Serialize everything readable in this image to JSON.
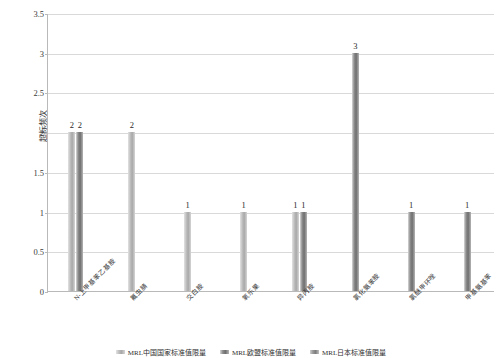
{
  "chart_data": {
    "type": "bar",
    "title": "",
    "xlabel": "",
    "ylabel": "超标频次",
    "ylim": [
      0,
      3.5
    ],
    "ytick_labels": [
      "0",
      "0.5",
      "1",
      "1.5",
      "2",
      "2.5",
      "3",
      "3.5"
    ],
    "ytick_values": [
      0,
      0.5,
      1,
      1.5,
      2,
      2.5,
      3,
      3.5
    ],
    "grid": true,
    "legend_position": "bottom",
    "categories": [
      "N-上甲基苯乙基胺",
      "氟虫腈",
      "交白胺",
      "氧乐果",
      "异丙胺",
      "氯化氨苯胺",
      "氯醚甲环唑",
      "甲基氨基苯"
    ],
    "series": [
      {
        "name": "MRL中国国家标准值限量",
        "color": "#bdbdbd",
        "values": [
          2,
          2,
          1,
          1,
          1,
          3,
          1,
          1
        ]
      },
      {
        "name": "MRL欧盟标准值限量",
        "color": "#8e8e8e",
        "values": [
          2,
          null,
          null,
          null,
          1,
          null,
          null,
          null
        ]
      },
      {
        "name": "MRL日本标准值限量",
        "color": "#9c9c9c",
        "values": [
          null,
          null,
          null,
          null,
          null,
          null,
          null,
          null
        ]
      }
    ],
    "bar_groups": [
      {
        "category_index": 0,
        "bars": [
          {
            "series": 0,
            "value": 2,
            "label": "2"
          },
          {
            "series": 1,
            "value": 2,
            "label": "2"
          }
        ]
      },
      {
        "category_index": 1,
        "bars": [
          {
            "series": 0,
            "value": 2,
            "label": "2"
          }
        ]
      },
      {
        "category_index": 2,
        "bars": [
          {
            "series": 0,
            "value": 1,
            "label": "1"
          }
        ]
      },
      {
        "category_index": 3,
        "bars": [
          {
            "series": 0,
            "value": 1,
            "label": "1"
          }
        ]
      },
      {
        "category_index": 4,
        "bars": [
          {
            "series": 0,
            "value": 1,
            "label": "1"
          },
          {
            "series": 1,
            "value": 1,
            "label": "1"
          }
        ]
      },
      {
        "category_index": 5,
        "bars": [
          {
            "series": 1,
            "value": 3,
            "label": "3"
          }
        ]
      },
      {
        "category_index": 6,
        "bars": [
          {
            "series": 1,
            "value": 1,
            "label": "1"
          }
        ]
      },
      {
        "category_index": 7,
        "bars": [
          {
            "series": 1,
            "value": 1,
            "label": "1"
          }
        ]
      }
    ],
    "legend": [
      {
        "label": "MRL中国国家标准值限量",
        "color": "#bdbdbd"
      },
      {
        "label": "MRL欧盟标准值限量",
        "color": "#8e8e8e"
      },
      {
        "label": "MRL日本标准值限量",
        "color": "#9c9c9c"
      }
    ]
  }
}
